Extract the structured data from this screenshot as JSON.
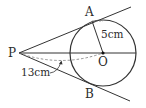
{
  "diagram": {
    "type": "geometry",
    "points": {
      "P": {
        "label": "P"
      },
      "A": {
        "label": "A"
      },
      "B": {
        "label": "B"
      },
      "O": {
        "label": "O"
      }
    },
    "measurements": {
      "radius_OA": "5cm",
      "distance_PO": "13cm"
    },
    "colors": {
      "stroke": "#333333",
      "dashed": "#777777",
      "text": "#2b2b2b"
    }
  }
}
